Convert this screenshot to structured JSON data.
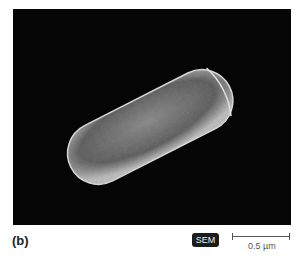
{
  "figure": {
    "panel_label": "(b)",
    "imaging_badge": "SEM",
    "scale_bar_text": "0.5 µm"
  }
}
